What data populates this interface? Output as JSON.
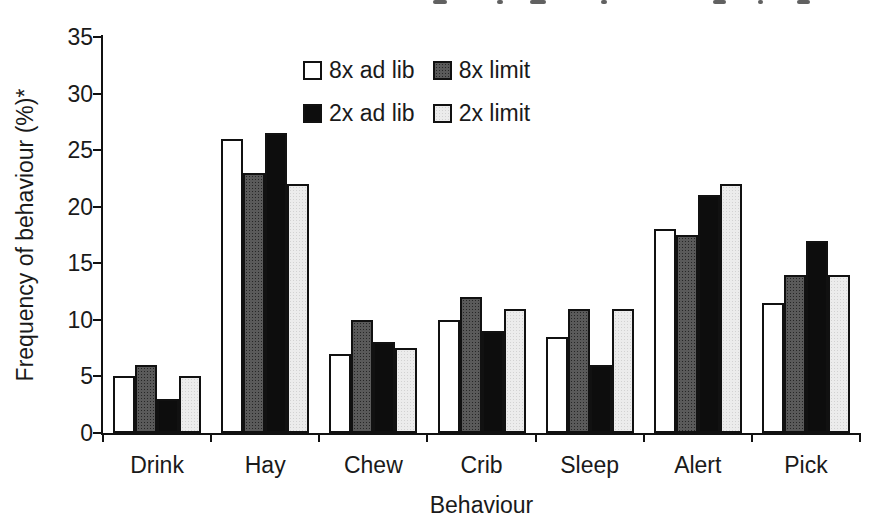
{
  "figure": {
    "background": "#ffffff",
    "text_color": "#1a1a1a"
  },
  "chart_data": {
    "type": "bar",
    "title": "",
    "xlabel": "Behaviour",
    "ylabel": "Frequency of behaviour (%)*",
    "ylim": [
      0,
      35
    ],
    "ytick_step": 5,
    "ytick_labels": [
      "0",
      "5",
      "10",
      "15",
      "20",
      "25",
      "30",
      "35"
    ],
    "grid": false,
    "legend_position": "top-center",
    "categories": [
      "Drink",
      "Hay",
      "Chew",
      "Crib",
      "Sleep",
      "Alert",
      "Pick"
    ],
    "series": [
      {
        "name": "8x ad lib",
        "style": "white",
        "color": "#ffffff",
        "values": [
          5,
          26,
          7,
          10,
          8.5,
          18,
          11.5
        ]
      },
      {
        "name": "8x limit",
        "style": "dark-dotted",
        "color": "#5a5a5a",
        "values": [
          6,
          23,
          10,
          12,
          11,
          17.5,
          14
        ]
      },
      {
        "name": "2x ad lib",
        "style": "black",
        "color": "#0d0d0d",
        "values": [
          3,
          26.5,
          8,
          9,
          6,
          21,
          17
        ]
      },
      {
        "name": "2x limit",
        "style": "light-dotted",
        "color": "#ececec",
        "values": [
          5,
          22,
          7.5,
          11,
          11,
          22,
          14
        ]
      }
    ]
  }
}
